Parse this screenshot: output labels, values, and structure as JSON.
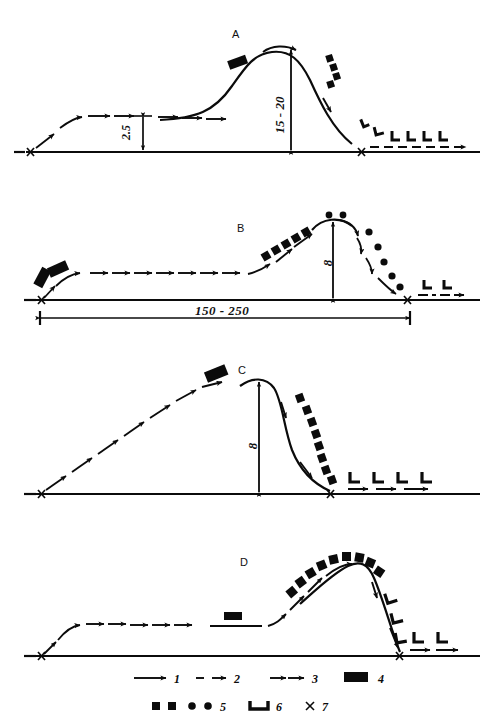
{
  "figure": {
    "title": "",
    "panels": [
      {
        "id": "A",
        "letter": "A",
        "letter_x": 232,
        "letter_y": 28,
        "baseline_y": 152,
        "start_marker": "x",
        "end_marker": "x",
        "labels": [
          {
            "text": "2.5",
            "kind": "vertical-dimension",
            "x": 126,
            "y": 120
          },
          {
            "text": "15 - 20",
            "kind": "vertical-dimension",
            "x": 272,
            "y": 90
          }
        ],
        "features": [
          "low-level outbound solid arrows",
          "2.5 altitude double-headed arrow",
          "steep climb to peak",
          "tilted black bar symbol near climb",
          "descending squares along downslope",
          "u-shaped symbols descending to baseline",
          "dashed outbound arrow on ground"
        ]
      },
      {
        "id": "B",
        "letter": "B",
        "letter_x": 237,
        "letter_y": 222,
        "baseline_y": 300,
        "start_marker": "x",
        "end_marker": "x",
        "labels": [
          {
            "text": "8",
            "kind": "vertical-dimension",
            "x": 330,
            "y": 262
          },
          {
            "text": "150 - 250",
            "kind": "horizontal-dimension",
            "x": 197,
            "y": 309
          }
        ],
        "features": [
          "two tilted black bar symbols at origin",
          "long level run of solid arrows",
          "ascending squares along climb",
          "dots along rounded peak and descent",
          "dashed arrows with u-symbols on ground"
        ]
      },
      {
        "id": "C",
        "letter": "C",
        "letter_x": 238,
        "letter_y": 364,
        "baseline_y": 494,
        "start_marker": "x",
        "end_marker": "x",
        "labels": [
          {
            "text": "8",
            "kind": "vertical-dimension",
            "x": 256,
            "y": 443
          }
        ],
        "features": [
          "long dashed ascending arrow ramp from origin",
          "tilted black bar symbol near top",
          "steep solid descent",
          "descending squares parallel to descent",
          "u-symbols with solid arrows on ground"
        ]
      },
      {
        "id": "D",
        "letter": "D",
        "letter_x": 240,
        "letter_y": 556,
        "baseline_y": 656,
        "start_marker": "x",
        "end_marker": "x",
        "labels": [],
        "features": [
          "low-level outbound solid arrows",
          "flat line segment with small black bar above",
          "dashed climb to peak",
          "arc of squares over the peak",
          "steep solid descent",
          "u-symbols along descent and on ground with arrows"
        ]
      }
    ]
  },
  "legend": {
    "rows": [
      [
        {
          "num": "1",
          "symbol": "solid-arrow",
          "x": 138
        },
        {
          "num": "2",
          "symbol": "dashed-arrow",
          "x": 210
        },
        {
          "num": "3",
          "symbol": "double-arrow",
          "x": 282
        },
        {
          "num": "4",
          "symbol": "black-rectangle",
          "x": 360
        }
      ],
      [
        {
          "num": "5",
          "symbol": "squares-and-dots",
          "x": 168
        },
        {
          "num": "6",
          "symbol": "u-shape-bar",
          "x": 258
        },
        {
          "num": "7",
          "symbol": "x-cross",
          "x": 312
        }
      ]
    ]
  },
  "colors": {
    "ink": "#0b0b0b",
    "paper": "#ffffff"
  }
}
